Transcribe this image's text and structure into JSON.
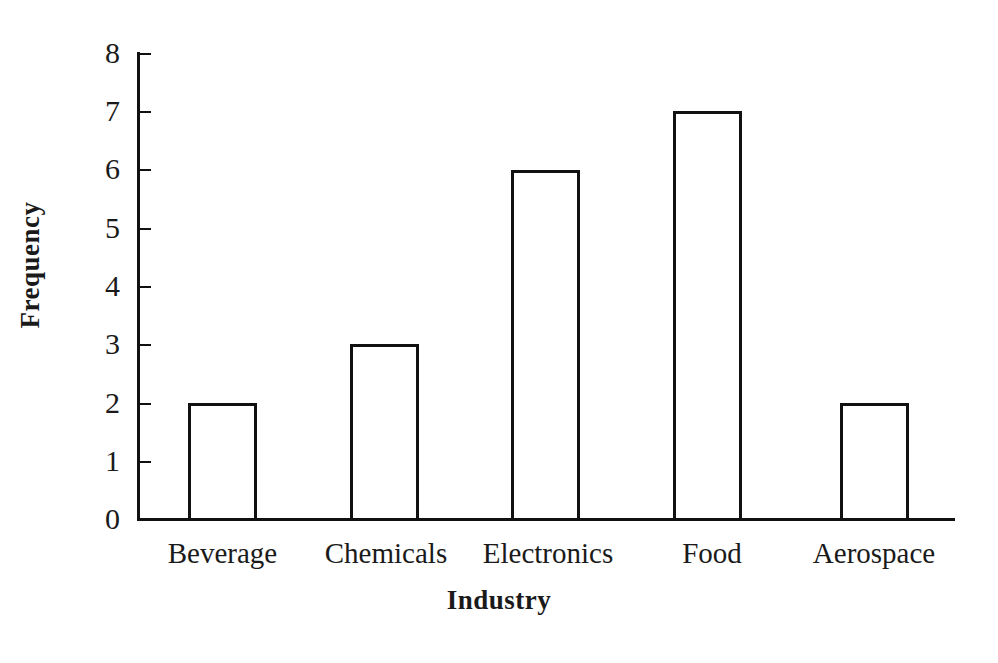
{
  "chart_data": {
    "type": "bar",
    "title": "",
    "subtitle": "",
    "xlabel": "Industry",
    "ylabel": "Frequency",
    "categories": [
      "Beverage",
      "Chemicals",
      "Electronics",
      "Food",
      "Aerospace"
    ],
    "values": [
      2,
      3,
      6,
      7,
      2
    ],
    "ylim": [
      0,
      8
    ],
    "ytick_labels": [
      "8",
      "7",
      "6",
      "5",
      "4",
      "3",
      "2",
      "1",
      "0"
    ],
    "ytick_values": [
      8,
      7,
      6,
      5,
      4,
      3,
      2,
      1,
      0
    ],
    "grid": false,
    "legend": null,
    "bar_fill_color": "#ffffff",
    "bar_edge_color": "#111111",
    "axis_color": "#111111",
    "background_color": "#ffffff",
    "annotations": []
  }
}
